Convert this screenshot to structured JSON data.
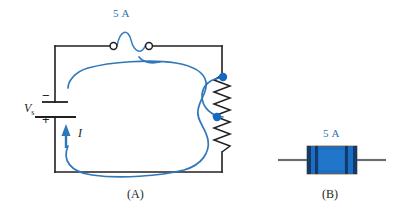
{
  "figure": {
    "type": "circuit-diagram",
    "background_color": "#ffffff"
  },
  "colors": {
    "wire": "#231f20",
    "current_blue": "#2f77bb",
    "node_blue": "#1569c0",
    "fuse_body": "#1a6fc4",
    "fuse_band": "#123a6b",
    "lead_gray": "#6d6e71",
    "text": "#231f20"
  },
  "panel_a": {
    "caption": "(A)",
    "fuse": {
      "rating_label": "5 A",
      "symbol": "fuse-symbol",
      "terminal_count": 2
    },
    "source": {
      "name": "Vs",
      "name_base": "V",
      "name_sub": "s",
      "negative_sign": "−",
      "positive_sign": "+",
      "symbol": "battery-symbol"
    },
    "current": {
      "label": "I",
      "direction": "up",
      "symbol": "current-arrow"
    },
    "load": {
      "symbol": "resistor-zigzag",
      "node_count": 2
    },
    "current_path": {
      "symbol": "current-loop-trace",
      "description": "freehand blue loop following circuit"
    }
  },
  "panel_b": {
    "caption": "(B)",
    "rating_label": "5 A",
    "component": "physical-fuse-photo",
    "lead_count": 2
  }
}
